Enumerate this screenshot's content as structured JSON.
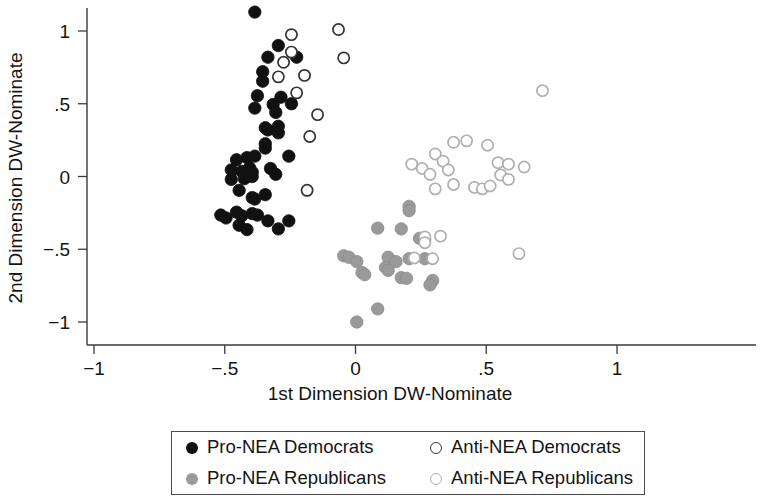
{
  "chart_data": {
    "type": "scatter",
    "title": "",
    "xlabel": "1st Dimension DW-Nominate",
    "ylabel": "2nd Dimension DW-Nominate",
    "xlim": [
      -1,
      1
    ],
    "ylim": [
      -1,
      1.2
    ],
    "xticks": [
      -1,
      -0.5,
      0,
      0.5,
      1
    ],
    "xticklabels": [
      "−1",
      "−.5",
      "0",
      ".5",
      "1"
    ],
    "yticks": [
      -1,
      -0.5,
      0,
      0.5,
      1
    ],
    "yticklabels": [
      "−1",
      "−.5",
      "0",
      ".5",
      "1"
    ],
    "grid": false,
    "legend_position": "below-center",
    "series": [
      {
        "name": "Pro-NEA Democrats",
        "marker": "filled-circle",
        "color": "#111111",
        "edgecolor": "#111111",
        "points": [
          [
            -0.385,
            1.13
          ],
          [
            -0.295,
            0.9
          ],
          [
            -0.335,
            0.82
          ],
          [
            -0.225,
            0.82
          ],
          [
            -0.355,
            0.72
          ],
          [
            -0.355,
            0.655
          ],
          [
            -0.375,
            0.555
          ],
          [
            -0.385,
            0.47
          ],
          [
            -0.285,
            0.545
          ],
          [
            -0.315,
            0.495
          ],
          [
            -0.305,
            0.44
          ],
          [
            -0.245,
            0.5
          ],
          [
            -0.345,
            0.335
          ],
          [
            -0.335,
            0.32
          ],
          [
            -0.295,
            0.345
          ],
          [
            -0.295,
            0.3
          ],
          [
            -0.345,
            0.225
          ],
          [
            -0.345,
            0.195
          ],
          [
            -0.255,
            0.14
          ],
          [
            -0.415,
            0.13
          ],
          [
            -0.385,
            0.14
          ],
          [
            -0.455,
            0.115
          ],
          [
            -0.475,
            0.045
          ],
          [
            -0.435,
            0.035
          ],
          [
            -0.405,
            0.06
          ],
          [
            -0.395,
            0.03
          ],
          [
            -0.325,
            0.055
          ],
          [
            -0.305,
            0.015
          ],
          [
            -0.475,
            -0.02
          ],
          [
            -0.425,
            -0.015
          ],
          [
            -0.395,
            0.0
          ],
          [
            -0.445,
            -0.095
          ],
          [
            -0.395,
            -0.145
          ],
          [
            -0.385,
            -0.155
          ],
          [
            -0.345,
            -0.125
          ],
          [
            -0.515,
            -0.265
          ],
          [
            -0.495,
            -0.285
          ],
          [
            -0.455,
            -0.245
          ],
          [
            -0.435,
            -0.27
          ],
          [
            -0.395,
            -0.255
          ],
          [
            -0.375,
            -0.265
          ],
          [
            -0.445,
            -0.335
          ],
          [
            -0.415,
            -0.365
          ],
          [
            -0.335,
            -0.305
          ],
          [
            -0.295,
            -0.36
          ],
          [
            -0.255,
            -0.305
          ]
        ]
      },
      {
        "name": "Pro-NEA Republicans",
        "marker": "filled-circle",
        "color": "#9a9a9a",
        "edgecolor": "#8a8a8a",
        "points": [
          [
            0.205,
            -0.205
          ],
          [
            0.205,
            -0.235
          ],
          [
            0.085,
            -0.355
          ],
          [
            0.175,
            -0.36
          ],
          [
            0.245,
            -0.425
          ],
          [
            0.265,
            -0.435
          ],
          [
            -0.045,
            -0.545
          ],
          [
            -0.025,
            -0.555
          ],
          [
            0.005,
            -0.585
          ],
          [
            0.125,
            -0.555
          ],
          [
            0.155,
            -0.585
          ],
          [
            0.205,
            -0.565
          ],
          [
            0.265,
            -0.565
          ],
          [
            0.115,
            -0.625
          ],
          [
            0.125,
            -0.645
          ],
          [
            0.025,
            -0.66
          ],
          [
            0.035,
            -0.675
          ],
          [
            0.175,
            -0.695
          ],
          [
            0.195,
            -0.7
          ],
          [
            0.295,
            -0.715
          ],
          [
            0.285,
            -0.745
          ],
          [
            0.085,
            -0.91
          ],
          [
            0.005,
            -1.0
          ]
        ]
      },
      {
        "name": "Anti-NEA Democrats",
        "marker": "open-circle",
        "color": "#ffffff",
        "edgecolor": "#333333",
        "points": [
          [
            -0.245,
            0.975
          ],
          [
            -0.065,
            1.01
          ],
          [
            -0.275,
            0.785
          ],
          [
            -0.045,
            0.815
          ],
          [
            -0.245,
            0.855
          ],
          [
            -0.295,
            0.685
          ],
          [
            -0.195,
            0.695
          ],
          [
            -0.225,
            0.575
          ],
          [
            -0.145,
            0.425
          ],
          [
            -0.175,
            0.275
          ],
          [
            -0.185,
            -0.095
          ]
        ]
      },
      {
        "name": "Anti-NEA Republicans",
        "marker": "open-circle",
        "color": "#ffffff",
        "edgecolor": "#b0b0b0",
        "points": [
          [
            0.715,
            0.59
          ],
          [
            0.375,
            0.235
          ],
          [
            0.425,
            0.245
          ],
          [
            0.305,
            0.155
          ],
          [
            0.335,
            0.105
          ],
          [
            0.505,
            0.215
          ],
          [
            0.215,
            0.085
          ],
          [
            0.255,
            0.055
          ],
          [
            0.285,
            0.015
          ],
          [
            0.355,
            0.045
          ],
          [
            0.545,
            0.095
          ],
          [
            0.585,
            0.085
          ],
          [
            0.645,
            0.065
          ],
          [
            0.375,
            -0.055
          ],
          [
            0.555,
            0.01
          ],
          [
            0.585,
            -0.02
          ],
          [
            0.305,
            -0.085
          ],
          [
            0.455,
            -0.075
          ],
          [
            0.485,
            -0.085
          ],
          [
            0.515,
            -0.065
          ],
          [
            0.265,
            -0.415
          ],
          [
            0.265,
            -0.455
          ],
          [
            0.325,
            -0.41
          ],
          [
            0.625,
            -0.53
          ],
          [
            0.225,
            -0.56
          ],
          [
            0.295,
            -0.565
          ]
        ]
      }
    ]
  },
  "legend": {
    "items": [
      {
        "label": "Pro-NEA Democrats",
        "marker": "filled-dark-circle-icon"
      },
      {
        "label": "Anti-NEA Democrats",
        "marker": "open-dark-circle-icon"
      },
      {
        "label": "Pro-NEA Republicans",
        "marker": "filled-gray-circle-icon"
      },
      {
        "label": "Anti-NEA Republicans",
        "marker": "open-gray-circle-icon"
      }
    ]
  }
}
